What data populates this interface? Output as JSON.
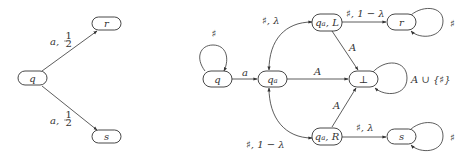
{
  "left_diagram": {
    "nodes": {
      "q": "q",
      "r": "r",
      "s": "s"
    },
    "edges": {
      "q_r": {
        "a": "a,",
        "p": "1/2",
        "num": "1",
        "den": "2"
      },
      "q_s": {
        "a": "a,",
        "p": "1/2",
        "num": "1",
        "den": "2"
      }
    }
  },
  "right_diagram": {
    "nodes": {
      "q": "q",
      "qa": "qa",
      "qa_main": "q",
      "qa_sub": "a",
      "qaL_main": "q",
      "qaL_sub": "a",
      "qaL_suffix": ", L",
      "qaR_main": "q",
      "qaR_sub": "a",
      "qaR_suffix": ", R",
      "r": "r",
      "bottom": "⊥",
      "s": "s"
    },
    "edges": {
      "q_loop": "♯",
      "q_qa": "a",
      "qa_qaL": "♯, λ",
      "qa_qaR": "♯, 1 − λ",
      "qa_bottom": "A",
      "qaL_r": "♯, 1 − λ",
      "qaL_bottom": "A",
      "qaR_bottom": "A",
      "qaR_s": "♯, λ",
      "r_loop": "♯",
      "bottom_loop": "A ∪ {♯}",
      "s_loop": "♯"
    }
  },
  "colors": {
    "stroke": "#333333",
    "background": "#ffffff"
  }
}
